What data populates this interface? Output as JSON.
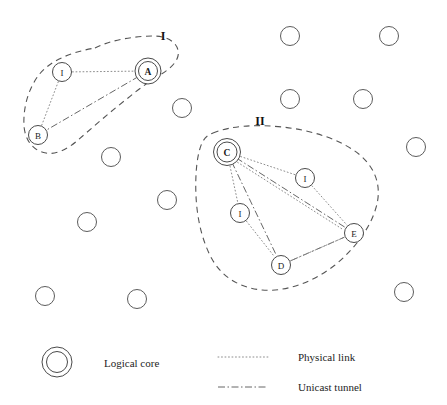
{
  "figure": {
    "width": 447,
    "height": 405,
    "background": "#ffffff",
    "stroke_color": "#555555",
    "node_stroke": "#4a4a4a",
    "text_color": "#1a1a1a"
  },
  "clusters": [
    {
      "id": "cluster-1",
      "label": "I",
      "label_x": 163,
      "label_y": 36,
      "outline": "M 95,48 C 110,40 135,36 155,36 C 172,37 180,46 178,56 C 176,64 168,70 160,75 C 150,81 140,88 128,98 C 110,112 92,128 78,140 C 68,149 56,155 46,153 C 33,151 25,140 24,126 C 23,108 28,90 38,76 C 50,60 72,52 95,48 Z"
    },
    {
      "id": "cluster-2",
      "label": "II",
      "label_x": 260,
      "label_y": 121,
      "outline": "M 213,133 C 230,126 255,124 282,127 C 312,130 342,140 360,155 C 376,169 381,186 377,204 C 372,225 357,247 335,265 C 312,283 285,292 262,290 C 240,288 222,277 212,259 C 202,241 197,218 196,196 C 195,174 197,154 202,143 C 205,137 208,135 213,133 Z"
    }
  ],
  "nodes": [
    {
      "id": "node-I1",
      "label": "I",
      "x": 62,
      "y": 72,
      "r": 9.5,
      "core": false
    },
    {
      "id": "node-A",
      "label": "A",
      "x": 148,
      "y": 71,
      "r": 9.5,
      "core": true
    },
    {
      "id": "node-B",
      "label": "B",
      "x": 38,
      "y": 135,
      "r": 9.5,
      "core": false
    },
    {
      "id": "node-C",
      "label": "C",
      "x": 227,
      "y": 152,
      "r": 10.0,
      "core": true
    },
    {
      "id": "node-I2",
      "label": "I",
      "x": 305,
      "y": 178,
      "r": 9.5,
      "core": false
    },
    {
      "id": "node-I3",
      "label": "I",
      "x": 240,
      "y": 213,
      "r": 9.5,
      "core": false
    },
    {
      "id": "node-E",
      "label": "E",
      "x": 354,
      "y": 233,
      "r": 9.5,
      "core": false
    },
    {
      "id": "node-D",
      "label": "D",
      "x": 281,
      "y": 265,
      "r": 9.5,
      "core": false
    }
  ],
  "plain_nodes": [
    {
      "id": "plain-1",
      "x": 290,
      "y": 36,
      "r": 9.5
    },
    {
      "id": "plain-2",
      "x": 389,
      "y": 36,
      "r": 9.5
    },
    {
      "id": "plain-3",
      "x": 182,
      "y": 108,
      "r": 9.5
    },
    {
      "id": "plain-4",
      "x": 290,
      "y": 99,
      "r": 9.5
    },
    {
      "id": "plain-5",
      "x": 363,
      "y": 99,
      "r": 9.5
    },
    {
      "id": "plain-6",
      "x": 111,
      "y": 157,
      "r": 9.5
    },
    {
      "id": "plain-7",
      "x": 416,
      "y": 147,
      "r": 9.5
    },
    {
      "id": "plain-8",
      "x": 167,
      "y": 200,
      "r": 9.5
    },
    {
      "id": "plain-9",
      "x": 87,
      "y": 222,
      "r": 9.5
    },
    {
      "id": "plain-10",
      "x": 45,
      "y": 296,
      "r": 9.5
    },
    {
      "id": "plain-11",
      "x": 137,
      "y": 299,
      "r": 9.5
    },
    {
      "id": "plain-12",
      "x": 404,
      "y": 292,
      "r": 9.5
    }
  ],
  "physical_links": [
    {
      "id": "link-I1-A",
      "from": "node-I1",
      "to": "node-A"
    },
    {
      "id": "link-I1-B",
      "from": "node-I1",
      "to": "node-B"
    },
    {
      "id": "link-C-I2",
      "from": "node-C",
      "to": "node-I2"
    },
    {
      "id": "link-I2-E",
      "from": "node-I2",
      "to": "node-E"
    },
    {
      "id": "link-C-I3",
      "from": "node-C",
      "to": "node-I3"
    },
    {
      "id": "link-I3-D",
      "from": "node-I3",
      "to": "node-D"
    },
    {
      "id": "link-D-E",
      "from": "node-D",
      "to": "node-E"
    },
    {
      "id": "link-C-E",
      "from": "node-C",
      "to": "node-E"
    }
  ],
  "unicast_tunnels": [
    {
      "id": "tunnel-A-B",
      "from": "node-A",
      "to": "node-B"
    },
    {
      "id": "tunnel-C-E",
      "from": "node-C",
      "to": "node-E"
    },
    {
      "id": "tunnel-C-D",
      "from": "node-C",
      "to": "node-D"
    },
    {
      "id": "tunnel-D-E",
      "from": "node-D",
      "to": "node-E"
    }
  ],
  "legend": {
    "core_icon": {
      "name": "logical-core-icon",
      "x": 57,
      "y": 362,
      "r_outer": 15,
      "r_inner": 10.5
    },
    "core_label": "Logical core",
    "core_label_x": 104,
    "core_label_y": 363,
    "physical_sample": {
      "x1": 218,
      "x2": 268,
      "y": 357
    },
    "physical_label": "Physical link",
    "physical_label_x": 298,
    "physical_label_y": 357,
    "tunnel_sample": {
      "x1": 218,
      "x2": 268,
      "y": 387
    },
    "tunnel_label": "Unicast tunnel",
    "tunnel_label_x": 298,
    "tunnel_label_y": 387
  }
}
